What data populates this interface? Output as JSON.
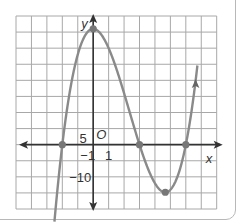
{
  "chart_data": {
    "type": "line",
    "title": "",
    "function": "y = (x + 2)(x - 3)(x - 6)",
    "xlabel": "x",
    "ylabel": "y",
    "origin_label": "O",
    "xlim": [
      -5,
      8
    ],
    "ylim": [
      -20,
      40
    ],
    "x_grid_step": 1,
    "y_grid_step": 5,
    "grid": true,
    "tick_labels": {
      "x": [
        {
          "value": -1,
          "text": "−1"
        },
        {
          "value": 1,
          "text": "1"
        }
      ],
      "y": [
        {
          "value": 5,
          "text": "5"
        },
        {
          "value": -10,
          "text": "−10"
        }
      ]
    },
    "marked_points": [
      {
        "x": -2,
        "y": 0,
        "kind": "x-intercept"
      },
      {
        "x": 0,
        "y": 36,
        "kind": "local maximum"
      },
      {
        "x": 3,
        "y": 0,
        "kind": "x-intercept"
      },
      {
        "x": 4.67,
        "y": -14.8,
        "kind": "local minimum"
      },
      {
        "x": 6,
        "y": 0,
        "kind": "x-intercept"
      }
    ],
    "curve_color": "#8a8a8a",
    "point_color": "#777777",
    "axis_color": "#333333",
    "grid_color": "#a8a8a8"
  }
}
